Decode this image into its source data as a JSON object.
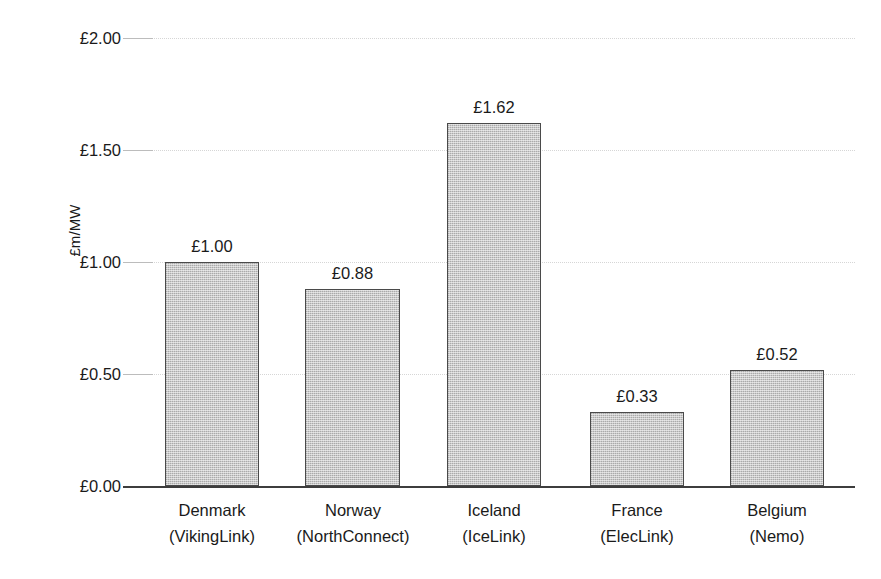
{
  "chart_data": {
    "type": "bar",
    "title": "",
    "subtitle": "",
    "xlabel": "",
    "ylabel": "£m/MW",
    "ylim": [
      0,
      2.0
    ],
    "ytick_values": [
      0,
      0.5,
      1.0,
      1.5,
      2.0
    ],
    "ytick_labels": [
      "£0.00",
      "£0.50",
      "£1.00",
      "£1.50",
      "£2.00"
    ],
    "grid": true,
    "grid_axis": "y",
    "legend": false,
    "legend_position": "none",
    "categories": [
      "Denmark (VikingLink)",
      "Norway (NorthConnect)",
      "Iceland (IceLink)",
      "France (ElecLink)",
      "Belgium (Nemo)"
    ],
    "category_lines": [
      [
        "Denmark",
        "(VikingLink)"
      ],
      [
        "Norway",
        "(NorthConnect)"
      ],
      [
        "Iceland",
        "(IceLink)"
      ],
      [
        "France",
        "(ElecLink)"
      ],
      [
        "Belgium",
        "(Nemo)"
      ]
    ],
    "values": [
      1.0,
      0.88,
      1.62,
      0.33,
      0.52
    ],
    "value_labels": [
      "£1.00",
      "£0.88",
      "£1.62",
      "£0.33",
      "£0.52"
    ],
    "colors": {
      "bar_fill": "#c9c9c9",
      "bar_border": "#4a4a4a",
      "gridline": "#d6d6d6",
      "axis_line": "#3d3d3d",
      "text": "#1a1a1a",
      "background": "#ffffff"
    }
  }
}
